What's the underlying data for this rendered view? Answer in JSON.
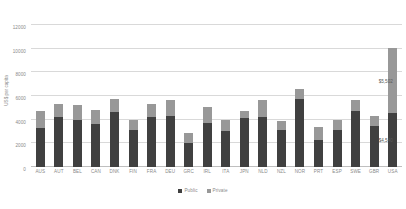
{
  "chart_data": {
    "type": "bar",
    "subtype": "stacked-column",
    "title": "",
    "xlabel": "",
    "ylabel": "US$ per capita",
    "ylim": [
      0,
      12000
    ],
    "ytick_values": [
      0,
      2000,
      4000,
      6000,
      8000,
      10000,
      12000
    ],
    "ytick_labels": [
      "0",
      "2000",
      "4000",
      "6000",
      "8000",
      "10000",
      "12000"
    ],
    "grid": true,
    "legend_position": "bottom",
    "categories": [
      "AUS",
      "AUT",
      "BEL",
      "CAN",
      "DNK",
      "FIN",
      "FRA",
      "DEU",
      "GRC",
      "IRL",
      "ITA",
      "JPN",
      "NLD",
      "NZL",
      "NOR",
      "PRT",
      "ESP",
      "SWE",
      "GBR",
      "USA"
    ],
    "series": [
      {
        "name": "Public",
        "color": "#404040",
        "values": [
          3300,
          4200,
          3950,
          3600,
          4650,
          3100,
          4200,
          4350,
          2000,
          3750,
          3050,
          4100,
          4200,
          3150,
          5750,
          2250,
          3100,
          4700,
          3500,
          4540
        ]
      },
      {
        "name": "Private",
        "color": "#989898",
        "values": [
          1400,
          1150,
          1250,
          1250,
          1100,
          900,
          1150,
          1350,
          900,
          1300,
          950,
          600,
          1500,
          700,
          850,
          1150,
          850,
          950,
          800,
          5502
        ]
      }
    ],
    "annotations": [
      {
        "text": "$5,502",
        "series": "Private",
        "category": "USA"
      },
      {
        "text": "$4,540",
        "series": "Public",
        "category": "USA"
      }
    ]
  },
  "legend": {
    "items": [
      {
        "label": "Public",
        "color": "#404040"
      },
      {
        "label": "Private",
        "color": "#989898"
      }
    ]
  }
}
